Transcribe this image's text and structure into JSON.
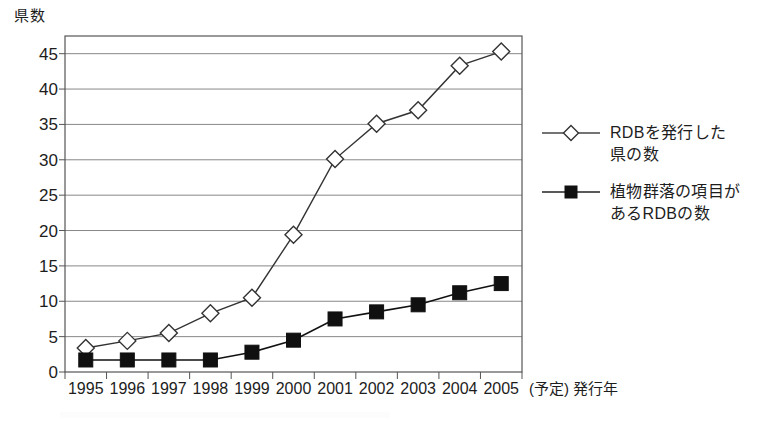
{
  "chart_data": {
    "type": "line",
    "title": "",
    "xlabel": "(予定) 発行年",
    "ylabel": "県数",
    "categories": [
      "1995",
      "1996",
      "1997",
      "1998",
      "1999",
      "2000",
      "2001",
      "2002",
      "2003",
      "2004",
      "2005"
    ],
    "x": [
      1995,
      1996,
      1997,
      1998,
      1999,
      2000,
      2001,
      2002,
      2003,
      2004,
      2005
    ],
    "xlim": [
      1994.5,
      2005.5
    ],
    "ylim": [
      0,
      47.5
    ],
    "yticks": [
      0,
      5,
      10,
      15,
      20,
      25,
      30,
      35,
      40,
      45
    ],
    "grid": true,
    "grid_axis": "y",
    "legend_position": "right",
    "series": [
      {
        "name": "RDBを発行した県の数",
        "marker": "diamond-open",
        "color": "#333333",
        "values": [
          3.4,
          4.4,
          5.5,
          8.3,
          10.5,
          19.4,
          30.1,
          35.1,
          37.0,
          43.3,
          45.3
        ]
      },
      {
        "name": "植物群落の項目があるRDBの数",
        "marker": "square-filled",
        "color": "#111111",
        "values": [
          1.7,
          1.7,
          1.7,
          1.7,
          2.8,
          4.5,
          7.5,
          8.5,
          9.5,
          11.2,
          12.5
        ]
      }
    ]
  },
  "axis": {
    "y_title": "県数",
    "x_title": "(予定) 発行年"
  },
  "legend": {
    "entries": [
      {
        "label": "RDBを発行した\n県の数",
        "marker": "diamond-open-icon"
      },
      {
        "label": "植物群落の項目が\nあるRDBの数",
        "marker": "square-filled-icon"
      }
    ]
  },
  "colors": {
    "line": "#333333",
    "grid": "#888888",
    "frame": "#555555",
    "marker_fill_open": "#ffffff",
    "marker_fill_solid": "#101010",
    "text": "#1d1d1d"
  }
}
